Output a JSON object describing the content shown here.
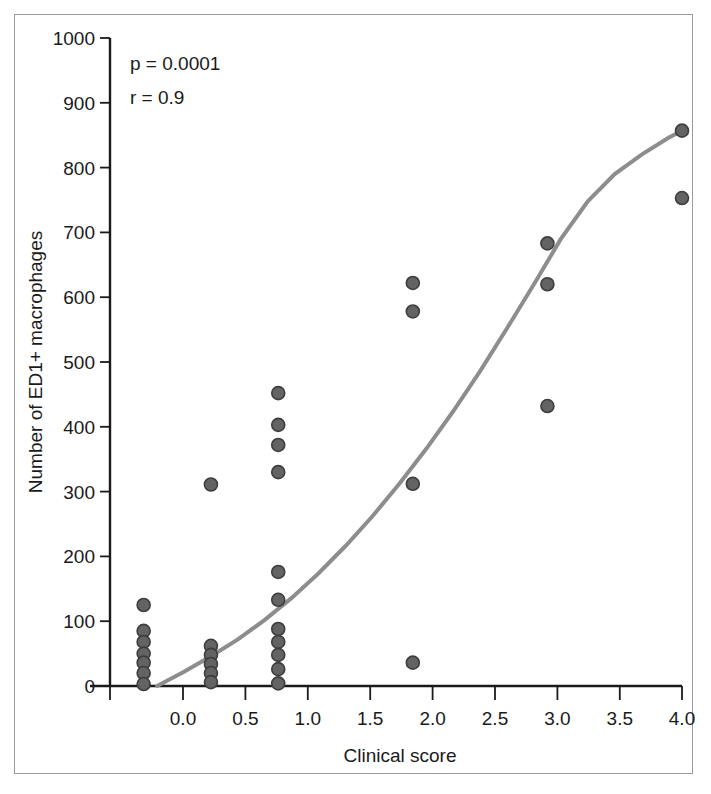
{
  "figure": {
    "frame_border_color": "#9a9a9a",
    "background_color": "#ffffff"
  },
  "annotations": {
    "p_value": "p = 0.0001",
    "r_value": "r = 0.9"
  },
  "chart_data": {
    "type": "scatter",
    "title": "",
    "xlabel": "Clinical score",
    "ylabel": "Number of ED1+ macrophages",
    "xlim": [
      -0.25,
      4.0
    ],
    "ylim": [
      0,
      1000
    ],
    "xticks": [
      0.0,
      0.5,
      1.0,
      1.5,
      2.0,
      2.5,
      3.0,
      3.5,
      4.0
    ],
    "xticklabels": [
      "0.0",
      "0.5",
      "1.0",
      "1.5",
      "2.0",
      "2.5",
      "3.0",
      "3.5",
      "4.0"
    ],
    "yticks": [
      0,
      100,
      200,
      300,
      400,
      500,
      600,
      700,
      800,
      900,
      1000
    ],
    "yticklabels": [
      "0",
      "100",
      "200",
      "300",
      "400",
      "500",
      "600",
      "700",
      "800",
      "900",
      "1000"
    ],
    "grid": false,
    "legend": null,
    "marker_color": "#636363",
    "marker_edge_color": "#3d3d3d",
    "marker_size": 13,
    "points": [
      {
        "x": 0.0,
        "y": 125
      },
      {
        "x": 0.0,
        "y": 85
      },
      {
        "x": 0.0,
        "y": 68
      },
      {
        "x": 0.0,
        "y": 50
      },
      {
        "x": 0.0,
        "y": 36
      },
      {
        "x": 0.0,
        "y": 20
      },
      {
        "x": 0.0,
        "y": 3
      },
      {
        "x": 0.5,
        "y": 311
      },
      {
        "x": 0.5,
        "y": 62
      },
      {
        "x": 0.5,
        "y": 48
      },
      {
        "x": 0.5,
        "y": 34
      },
      {
        "x": 0.5,
        "y": 20
      },
      {
        "x": 0.5,
        "y": 6
      },
      {
        "x": 1.0,
        "y": 452
      },
      {
        "x": 1.0,
        "y": 403
      },
      {
        "x": 1.0,
        "y": 372
      },
      {
        "x": 1.0,
        "y": 330
      },
      {
        "x": 1.0,
        "y": 176
      },
      {
        "x": 1.0,
        "y": 133
      },
      {
        "x": 1.0,
        "y": 88
      },
      {
        "x": 1.0,
        "y": 68
      },
      {
        "x": 1.0,
        "y": 48
      },
      {
        "x": 1.0,
        "y": 26
      },
      {
        "x": 1.0,
        "y": 4
      },
      {
        "x": 2.0,
        "y": 622
      },
      {
        "x": 2.0,
        "y": 578
      },
      {
        "x": 2.0,
        "y": 312
      },
      {
        "x": 2.0,
        "y": 36
      },
      {
        "x": 3.0,
        "y": 683
      },
      {
        "x": 3.0,
        "y": 620
      },
      {
        "x": 3.0,
        "y": 432
      },
      {
        "x": 4.0,
        "y": 857
      },
      {
        "x": 4.0,
        "y": 753
      }
    ],
    "fit_curve": {
      "name": "exponential fit",
      "color": "#8d8d8d",
      "x": [
        0.1,
        0.3,
        0.5,
        0.7,
        0.9,
        1.1,
        1.3,
        1.5,
        1.7,
        1.9,
        2.1,
        2.3,
        2.5,
        2.7,
        2.9,
        3.1,
        3.3,
        3.5,
        3.7,
        3.9,
        4.0
      ],
      "y": [
        0,
        22,
        46,
        72,
        102,
        136,
        174,
        216,
        262,
        312,
        366,
        424,
        486,
        552,
        620,
        690,
        748,
        790,
        820,
        846,
        857
      ]
    }
  }
}
